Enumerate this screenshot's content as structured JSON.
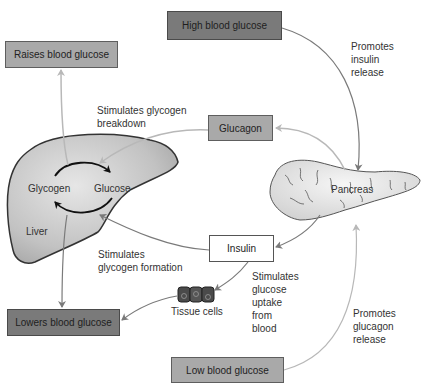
{
  "boxes": {
    "raises": "Raises blood glucose",
    "high": "High blood glucose",
    "glucagon": "Glucagon",
    "insulin": "Insulin",
    "lowers": "Lowers blood glucose",
    "low": "Low blood glucose"
  },
  "organs": {
    "liver": "Liver",
    "pancreas": "Pancreas",
    "tissue": "Tissue cells",
    "glycogen": "Glycogen",
    "glucose": "Glucose"
  },
  "annotations": {
    "breakdown": [
      "Stimulates glycogen",
      "breakdown"
    ],
    "formation": [
      "Stimulates",
      "glycogen formation"
    ],
    "insulin_release": [
      "Promotes",
      "insulin",
      "release"
    ],
    "glucagon_release": [
      "Promotes",
      "glucagon",
      "release"
    ],
    "uptake": [
      "Stimulates",
      "glucose",
      "uptake",
      "from",
      "blood"
    ]
  },
  "colors": {
    "dark_box": "#7a7a7a",
    "mid_box": "#a9a9a9",
    "arrow_dark": "#777777",
    "arrow_light": "#b0b0b0",
    "organ_fill": "#c8c8c8"
  }
}
